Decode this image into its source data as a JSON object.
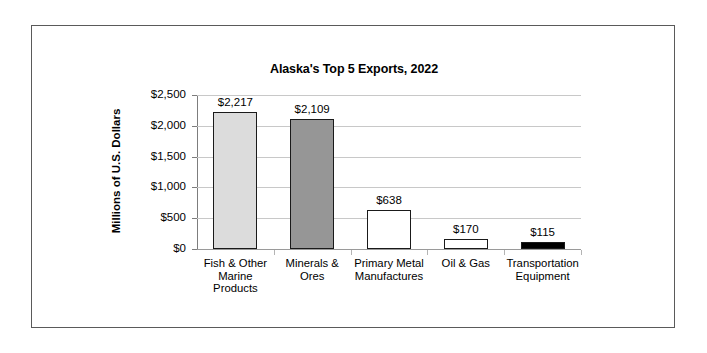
{
  "chart_data": {
    "type": "bar",
    "title": "Alaska's Top 5 Exports, 2022",
    "xlabel": "",
    "ylabel": "Millions of U.S. Dollars",
    "ylim": [
      0,
      2500
    ],
    "ytick_labels": [
      "$2,500",
      "$2,000",
      "$1,500",
      "$1,000",
      "$500",
      "$0"
    ],
    "ytick_values": [
      2500,
      2000,
      1500,
      1000,
      500,
      0
    ],
    "grid": true,
    "legend": "none",
    "categories": [
      "Fish & Other Marine Products",
      "Minerals & Ores",
      "Primary Metal Manufactures",
      "Oil & Gas",
      "Transportation Equipment"
    ],
    "category_lines": [
      [
        "Fish & Other",
        "Marine",
        "Products"
      ],
      [
        "Minerals &",
        "Ores"
      ],
      [
        "Primary Metal",
        "Manufactures"
      ],
      [
        "Oil & Gas"
      ],
      [
        "Transportation",
        "Equipment"
      ]
    ],
    "values": [
      2217,
      2109,
      638,
      170,
      115
    ],
    "value_labels": [
      "$2,217",
      "$2,109",
      "$638",
      "$170",
      "$115"
    ],
    "bar_colors": [
      "#dcdcdc",
      "#969696",
      "#ffffff",
      "#ffffff",
      "#000000"
    ],
    "bar_border_color": "#1a1a1a",
    "gridline_color": "#c8c8c8",
    "axis_color": "#7d7d7d",
    "frame_color": "#5a5a5a",
    "background": "#ffffff",
    "text_color": "#000000"
  }
}
